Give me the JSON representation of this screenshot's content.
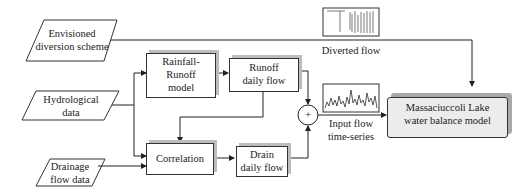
{
  "diagram": {
    "inputs": {
      "diversion": "Envisioned diversion scheme",
      "diversion_l1": "Envisioned",
      "diversion_l2": "diversion scheme",
      "hydro_l1": "Hydrological",
      "hydro_l2": "data",
      "drain_l1": "Drainage",
      "drain_l2": "flow data"
    },
    "process": {
      "rr_l1": "Rainfall-",
      "rr_l2": "Runoff",
      "rr_l3": "model",
      "runoff_l1": "Runoff",
      "runoff_l2": "daily flow",
      "correlation": "Correlation",
      "drainflow_l1": "Drain",
      "drainflow_l2": "daily flow",
      "sum_symbol": "+"
    },
    "outputs": {
      "diverted_label": "Diverted flow",
      "input_l1": "Input flow",
      "input_l2": "time-series",
      "final_l1": "Massaciuccoli Lake",
      "final_l2": "water balance model"
    },
    "colors": {
      "line": "#222222",
      "shadow": "#bdbdbd",
      "final_fill": "#ececec"
    }
  }
}
